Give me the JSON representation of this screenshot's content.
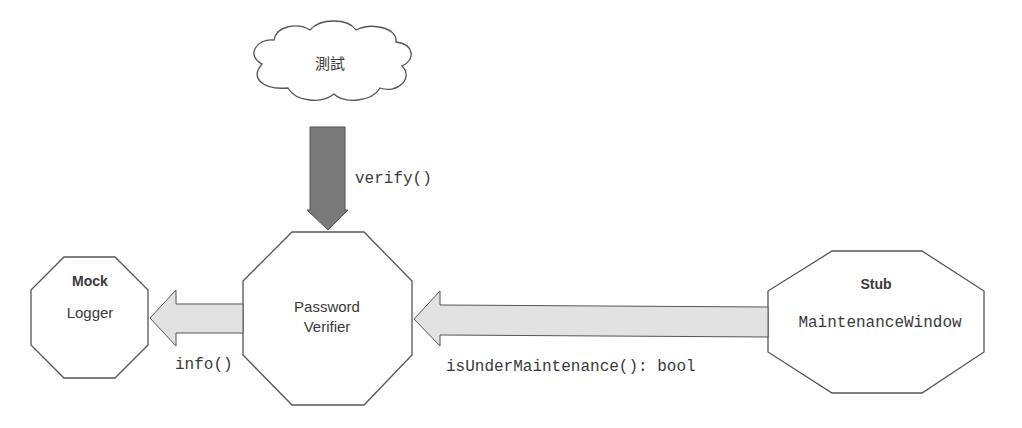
{
  "diagram": {
    "cloud": {
      "label": "測試"
    },
    "arrows": {
      "verify": {
        "label": "verify()"
      },
      "info": {
        "label": "info()"
      },
      "maintenance": {
        "label": "isUnderMaintenance(): bool"
      }
    },
    "nodes": {
      "mock": {
        "stereotype": "Mock",
        "name": "Logger"
      },
      "verifier": {
        "line1": "Password",
        "line2": "Verifier"
      },
      "stub": {
        "stereotype": "Stub",
        "name": "MaintenanceWindow"
      }
    },
    "colors": {
      "stroke": "#555555",
      "down_arrow_fill": "#7a7a7a",
      "side_arrow_fill": "#e2e2e2",
      "text": "#3a3a3a"
    }
  }
}
